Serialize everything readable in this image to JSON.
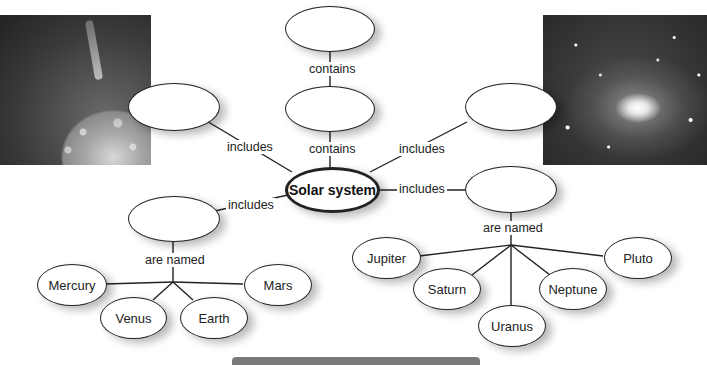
{
  "diagram": {
    "center": {
      "label": "Solar system"
    },
    "link_labels": {
      "contains_top": "contains",
      "contains_mid": "contains",
      "includes_upper_left": "includes",
      "includes_upper_right": "includes",
      "includes_lower_left": "includes",
      "includes_lower_right": "includes",
      "are_named_left": "are named",
      "are_named_right": "are named"
    },
    "blank_nodes": {
      "top": "",
      "middle": "",
      "upper_left": "",
      "upper_right": "",
      "lower_left": "",
      "lower_right": ""
    },
    "inner_planets": [
      "Mercury",
      "Venus",
      "Earth",
      "Mars"
    ],
    "outer_planets": [
      "Jupiter",
      "Saturn",
      "Uranus",
      "Neptune",
      "Pluto"
    ],
    "images": {
      "left": "sun-photo",
      "right": "spiral-galaxy-photo"
    }
  }
}
